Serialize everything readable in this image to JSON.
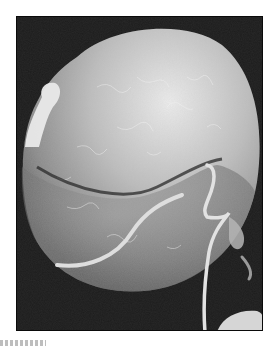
{
  "figure": {
    "features": [
      "textured spherical cell body",
      "transverse groove (cingulum)",
      "transverse flagellum",
      "trailing longitudinal flagellum",
      "partial neighboring cell at bottom right"
    ],
    "colors": {
      "background": "#1c1c1c",
      "cell_light": "#e6e6e6",
      "cell_mid": "#a8a8a8",
      "cell_shadow": "#5a5a5a",
      "flagellum": "#dcdcdc",
      "page": "#ffffff"
    }
  },
  "caption": {
    "visible_text": ""
  }
}
